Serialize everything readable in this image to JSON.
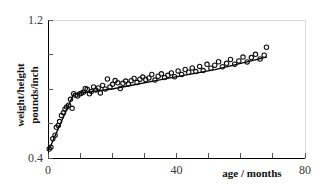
{
  "chart_data": {
    "type": "scatter",
    "title": "",
    "subtitle": "",
    "xlabel": "age / months",
    "ylabel": "weight/height pounds/inch",
    "ylabel_line1": "weight/height",
    "ylabel_line2": "pounds/inch",
    "xlim": [
      0,
      80
    ],
    "ylim": [
      0.4,
      1.2
    ],
    "xticks": [
      0,
      10,
      20,
      30,
      40,
      50,
      60,
      70,
      80
    ],
    "xtick_labels": [
      "0",
      "",
      "",
      "",
      "40",
      "",
      "",
      "",
      "80"
    ],
    "yticks": [
      0.4,
      0.6,
      0.8,
      1.0,
      1.2
    ],
    "ytick_labels": [
      "0.4",
      "",
      "",
      "",
      "1.2"
    ],
    "grid": false,
    "legend": "none",
    "marker_style": "open-circle",
    "series": [
      {
        "name": "observations",
        "x": [
          0.4,
          0.9,
          1.5,
          2.2,
          2.6,
          3.2,
          3.6,
          4.2,
          4.8,
          5.3,
          5.8,
          6.4,
          7.0,
          7.5,
          8.0,
          8.6,
          9.2,
          9.8,
          10.4,
          11.0,
          11.6,
          12.2,
          12.9,
          13.5,
          14.2,
          14.9,
          15.6,
          16.3,
          17.0,
          17.8,
          18.5,
          19.3,
          20.1,
          20.9,
          21.7,
          22.5,
          23.3,
          24.2,
          25.0,
          25.9,
          26.8,
          27.7,
          28.6,
          29.5,
          30.4,
          31.4,
          32.3,
          33.3,
          34.3,
          35.3,
          36.3,
          37.3,
          38.4,
          39.4,
          40.5,
          41.6,
          42.7,
          43.8,
          44.9,
          46.0,
          47.2,
          48.3,
          49.5,
          50.7,
          51.9,
          53.1,
          54.3,
          55.6,
          56.8,
          58.1,
          59.4,
          60.7,
          62.0,
          63.3,
          64.6,
          66.0,
          67.3,
          68.0
        ],
        "y": [
          0.452,
          0.462,
          0.511,
          0.532,
          0.578,
          0.589,
          0.611,
          0.647,
          0.662,
          0.684,
          0.695,
          0.706,
          0.74,
          0.688,
          0.773,
          0.764,
          0.759,
          0.771,
          0.776,
          0.781,
          0.803,
          0.798,
          0.772,
          0.785,
          0.812,
          0.794,
          0.806,
          0.777,
          0.821,
          0.8,
          0.858,
          0.812,
          0.827,
          0.849,
          0.836,
          0.803,
          0.833,
          0.846,
          0.829,
          0.848,
          0.861,
          0.838,
          0.857,
          0.869,
          0.855,
          0.864,
          0.884,
          0.852,
          0.874,
          0.888,
          0.866,
          0.879,
          0.893,
          0.871,
          0.905,
          0.884,
          0.913,
          0.897,
          0.922,
          0.901,
          0.931,
          0.907,
          0.943,
          0.921,
          0.938,
          0.958,
          0.929,
          0.949,
          0.971,
          0.944,
          0.963,
          0.985,
          0.957,
          0.982,
          1.001,
          0.974,
          0.996,
          1.042
        ]
      }
    ],
    "fit_line": {
      "name": "piecewise fit",
      "x": [
        0.4,
        8.0,
        20.0,
        36.0,
        52.0,
        68.0
      ],
      "y": [
        0.452,
        0.772,
        0.8,
        0.857,
        0.912,
        0.985
      ]
    }
  }
}
